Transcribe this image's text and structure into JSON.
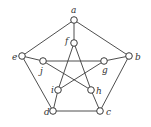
{
  "diagram": {
    "type": "graph",
    "name": "Petersen graph",
    "nodes": [
      {
        "id": "a",
        "label": "a",
        "x": 74,
        "y": 20,
        "lx": 71,
        "ly": 13
      },
      {
        "id": "b",
        "label": "b",
        "x": 129,
        "y": 56,
        "lx": 135,
        "ly": 60
      },
      {
        "id": "c",
        "label": "c",
        "x": 100,
        "y": 111,
        "lx": 106,
        "ly": 115
      },
      {
        "id": "d",
        "label": "d",
        "x": 53,
        "y": 111,
        "lx": 44,
        "ly": 115
      },
      {
        "id": "e",
        "label": "e",
        "x": 22,
        "y": 56,
        "lx": 12,
        "ly": 60
      },
      {
        "id": "f",
        "label": "f",
        "x": 74,
        "y": 43,
        "lx": 65,
        "ly": 44
      },
      {
        "id": "g",
        "label": "g",
        "x": 104,
        "y": 61,
        "lx": 102,
        "ly": 73
      },
      {
        "id": "h",
        "label": "h",
        "x": 91,
        "y": 90,
        "lx": 96,
        "ly": 94
      },
      {
        "id": "i",
        "label": "i",
        "x": 58,
        "y": 90,
        "lx": 51,
        "ly": 93
      },
      {
        "id": "j",
        "label": "j",
        "x": 43,
        "y": 61,
        "lx": 40,
        "ly": 74
      }
    ],
    "edges": [
      [
        "a",
        "b"
      ],
      [
        "b",
        "c"
      ],
      [
        "c",
        "d"
      ],
      [
        "d",
        "e"
      ],
      [
        "e",
        "a"
      ],
      [
        "a",
        "f"
      ],
      [
        "b",
        "g"
      ],
      [
        "c",
        "h"
      ],
      [
        "d",
        "i"
      ],
      [
        "e",
        "j"
      ],
      [
        "f",
        "i"
      ],
      [
        "f",
        "h"
      ],
      [
        "j",
        "g"
      ],
      [
        "j",
        "h"
      ],
      [
        "g",
        "i"
      ]
    ]
  }
}
